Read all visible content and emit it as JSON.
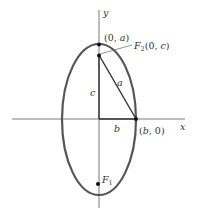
{
  "diagram": {
    "axes": {
      "x_label": "x",
      "y_label": "y"
    },
    "points": {
      "vertex_top": "(0, a)",
      "focus_top": "F2(0, c)",
      "focus_top_name": "F",
      "focus_top_sub": "2",
      "focus_top_coords": "(0, c)",
      "co_vertex": "(b, 0)",
      "focus_bottom_name": "F",
      "focus_bottom_sub": "1"
    },
    "segments": {
      "hypotenuse": "a",
      "vertical_leg": "c",
      "horizontal_leg": "b"
    },
    "colors": {
      "ellipse": "#555555",
      "axes": "#777777",
      "lines": "#444444",
      "text": "#333333"
    }
  }
}
